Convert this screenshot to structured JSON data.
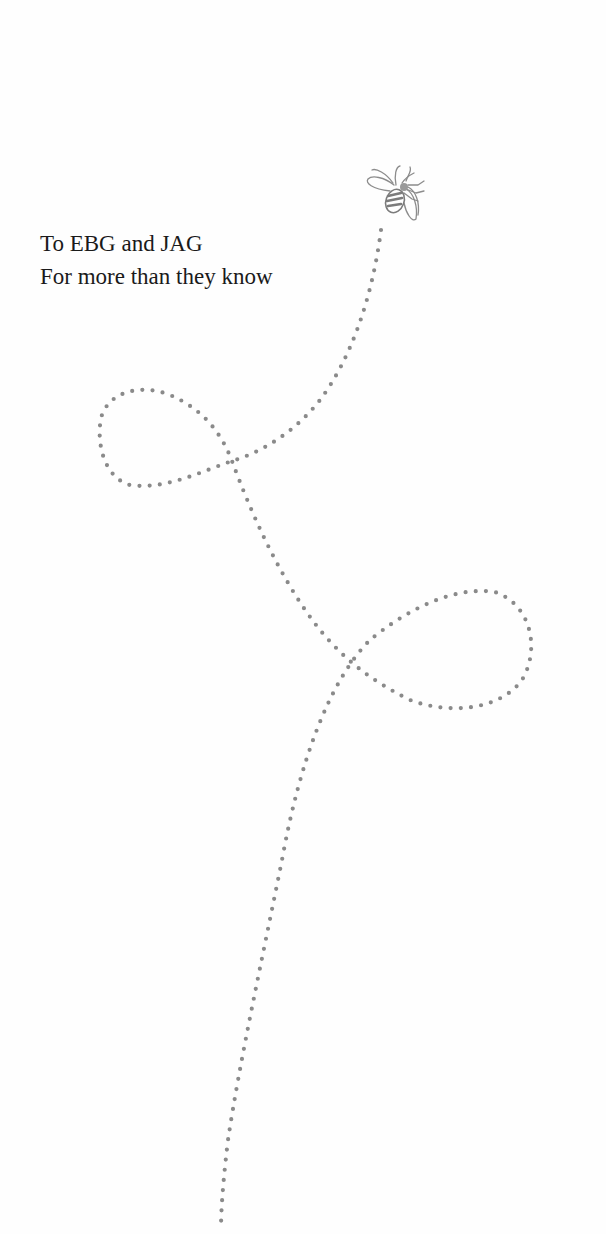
{
  "dedication": {
    "line1": "To EBG and JAG",
    "line2": "For more than they know"
  },
  "illustration": {
    "bee_icon": "bee-icon",
    "trail": "dotted-flight-path",
    "dot_color": "#8a8a8a"
  }
}
